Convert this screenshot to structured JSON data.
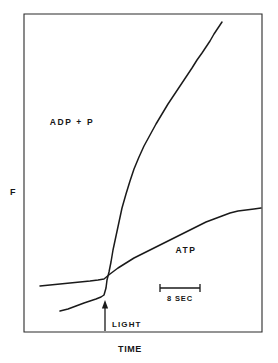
{
  "figure": {
    "background_color": "#ffffff",
    "ink_color": "#1a1a1a",
    "frame_color": "#2b2b2b"
  },
  "axes": {
    "y_label": "F",
    "x_label": "TIME"
  },
  "annotations": {
    "light_marker": "LIGHT",
    "scale_bar": "8 SEC"
  },
  "series_labels": {
    "adp": "ADP + P",
    "atp": "ATP"
  },
  "chart_data": {
    "type": "line",
    "title": "",
    "subtitle": "",
    "xlabel": "TIME",
    "ylabel": "F",
    "grid": false,
    "legend": "inline-annotations",
    "axis_ticks": {
      "x": [],
      "y": []
    },
    "axis_note": "Both axes are unlabeled/arbitrary units; only a horizontal 8 SEC scale bar is given.",
    "scale_bar": {
      "label": "8 SEC",
      "orientation": "horizontal",
      "length_px": 40,
      "x_start_px": 160,
      "x_end_px": 200,
      "y_px": 288
    },
    "event_markers": [
      {
        "label": "LIGHT",
        "type": "up-arrow",
        "x_px": 105,
        "y_px": 305,
        "note": "Arrow marks onset of illumination; both traces change slope at this point."
      }
    ],
    "plot_frame_px": {
      "left": 24,
      "top": 14,
      "right": 262,
      "bottom": 332
    },
    "series": [
      {
        "name": "ADP + P",
        "label_position_px": {
          "x": 72,
          "y": 122
        },
        "description": "Flat-to-slowly-rising baseline before light, then a very steep sustained rise after light onset, continuing to the top right of the frame.",
        "points_px": [
          [
            60,
            311
          ],
          [
            68,
            309
          ],
          [
            76,
            306
          ],
          [
            84,
            303
          ],
          [
            90,
            301
          ],
          [
            96,
            299
          ],
          [
            101,
            297
          ],
          [
            104,
            295
          ],
          [
            106,
            288
          ],
          [
            107,
            280
          ],
          [
            109,
            272
          ],
          [
            111,
            262
          ],
          [
            113,
            250
          ],
          [
            116,
            236
          ],
          [
            119,
            222
          ],
          [
            122,
            208
          ],
          [
            126,
            194
          ],
          [
            130,
            181
          ],
          [
            134,
            169
          ],
          [
            139,
            157
          ],
          [
            144,
            146
          ],
          [
            150,
            135
          ],
          [
            156,
            124
          ],
          [
            162,
            114
          ],
          [
            168,
            104
          ],
          [
            174,
            95
          ],
          [
            180,
            86
          ],
          [
            186,
            77
          ],
          [
            192,
            68
          ],
          [
            197,
            60
          ],
          [
            202,
            53
          ],
          [
            206,
            47
          ],
          [
            210,
            41
          ],
          [
            214,
            34
          ],
          [
            218,
            28
          ],
          [
            222,
            22
          ]
        ]
      },
      {
        "name": "ATP",
        "label_position_px": {
          "x": 186,
          "y": 250
        },
        "description": "Nearly flat baseline before light, then a modest steady rise after light onset, reaching the right edge of the frame.",
        "points_px": [
          [
            40,
            286
          ],
          [
            50,
            285
          ],
          [
            60,
            284
          ],
          [
            70,
            283
          ],
          [
            80,
            282
          ],
          [
            90,
            281
          ],
          [
            98,
            280
          ],
          [
            104,
            279
          ],
          [
            110,
            274
          ],
          [
            118,
            268
          ],
          [
            126,
            263
          ],
          [
            134,
            258
          ],
          [
            142,
            254
          ],
          [
            150,
            250
          ],
          [
            158,
            246
          ],
          [
            166,
            242
          ],
          [
            174,
            238
          ],
          [
            182,
            234
          ],
          [
            190,
            230
          ],
          [
            198,
            226
          ],
          [
            206,
            222
          ],
          [
            214,
            219
          ],
          [
            222,
            216
          ],
          [
            230,
            213
          ],
          [
            238,
            211
          ],
          [
            246,
            210
          ],
          [
            254,
            209
          ],
          [
            261,
            208
          ]
        ]
      }
    ]
  }
}
